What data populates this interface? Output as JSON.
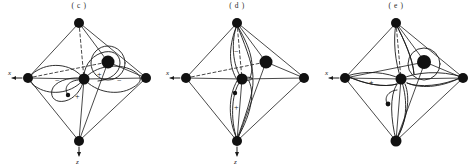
{
  "figure": {
    "background_color": "#ffffff",
    "ink_color": "#1a1a1a",
    "panel_count": 3
  },
  "panels": [
    {
      "label": "( c )",
      "name": "panel-c",
      "orbital_type": "in-plane four-lobed d orbital with sigma overlap",
      "axes": [
        {
          "name": "x",
          "label": "x",
          "direction": "left",
          "arrow": "←"
        },
        {
          "name": "z",
          "label": "z",
          "direction": "down",
          "arrow": "↓"
        }
      ],
      "signs": [
        {
          "text": "−",
          "lobe": "left-lobe"
        },
        {
          "text": "+",
          "lobe": "center-upper-lobe"
        },
        {
          "text": "−",
          "lobe": "right-lobe"
        },
        {
          "text": "+",
          "lobe": "lower-lobe"
        }
      ],
      "atoms": {
        "vertices": 4,
        "interior": 2,
        "node_dot": 1
      }
    },
    {
      "label": "( d )",
      "name": "panel-d",
      "orbital_type": "vertical p-type orbital aligned with z axis",
      "axes": [
        {
          "name": "x",
          "label": "x",
          "direction": "left",
          "arrow": "←"
        },
        {
          "name": "z",
          "label": "z",
          "direction": "down",
          "arrow": "↓"
        }
      ],
      "signs": [
        {
          "text": "−",
          "lobe": "upper-lobe"
        },
        {
          "text": "+",
          "lobe": "lower-lobe"
        }
      ],
      "atoms": {
        "vertices": 4,
        "interior": 2,
        "node_dot": 1
      }
    },
    {
      "label": "( e )",
      "name": "panel-e",
      "orbital_type": "four-lobed cloverleaf d orbital between ligand axes",
      "axes": [
        {
          "name": "x",
          "label": "x",
          "direction": "left",
          "arrow": "←"
        }
      ],
      "signs": [
        {
          "text": "+",
          "lobe": "left-lobe"
        }
      ],
      "atoms": {
        "vertices": 4,
        "interior": 2,
        "node_dot": 1
      }
    }
  ]
}
